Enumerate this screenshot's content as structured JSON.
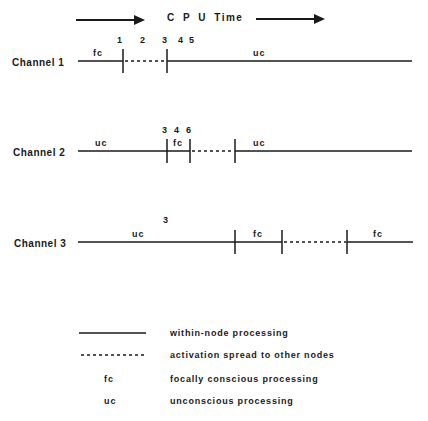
{
  "header": {
    "title": "C P U   Time"
  },
  "channels": [
    {
      "label": "Channel  1",
      "time_markers": [
        "1",
        "2",
        "3",
        "4",
        "5"
      ],
      "segments": [
        {
          "type": "fc",
          "style": "solid"
        },
        {
          "type": "",
          "style": "dashed"
        },
        {
          "type": "uc",
          "style": "solid"
        }
      ]
    },
    {
      "label": "Channel  2",
      "time_markers": [
        "3",
        "4",
        "6"
      ],
      "segments": [
        {
          "type": "uc",
          "style": "solid"
        },
        {
          "type": "fc",
          "style": "solid"
        },
        {
          "type": "",
          "style": "dashed"
        },
        {
          "type": "uc",
          "style": "solid"
        }
      ]
    },
    {
      "label": "Channel  3",
      "time_markers": [
        "3"
      ],
      "segments": [
        {
          "type": "uc",
          "style": "solid"
        },
        {
          "type": "fc",
          "style": "solid"
        },
        {
          "type": "",
          "style": "dashed"
        },
        {
          "type": "fc",
          "style": "solid"
        }
      ]
    }
  ],
  "legend": [
    {
      "symbol": "solid-line",
      "text": "within-node  processing"
    },
    {
      "symbol": "dashed-line",
      "text": "activation  spread  to  other  nodes"
    },
    {
      "symbol": "fc",
      "text": "focally  conscious  processing"
    },
    {
      "symbol": "uc",
      "text": "unconscious  processing"
    }
  ]
}
